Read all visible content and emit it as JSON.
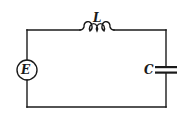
{
  "diagram": {
    "type": "LC circuit with source",
    "components": [
      {
        "id": "source",
        "symbol": "E",
        "kind": "voltage-source"
      },
      {
        "id": "inductor",
        "symbol": "L",
        "kind": "inductor"
      },
      {
        "id": "capacitor",
        "symbol": "C",
        "kind": "capacitor"
      }
    ],
    "labels": {
      "source": "E",
      "inductor": "L",
      "capacitor": "C"
    },
    "colors": {
      "stroke": "#1a1a1a",
      "background": "#ffffff"
    }
  }
}
